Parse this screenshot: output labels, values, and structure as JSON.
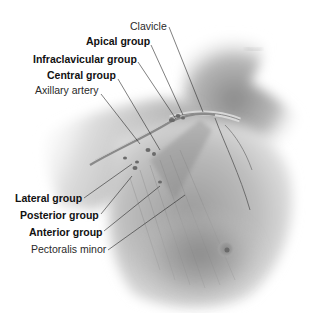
{
  "figure": {
    "illustration": "grayscale anatomical rendering of right shoulder, neck and chest with lymph nodes and muscles"
  },
  "labels": [
    {
      "id": "clavicle",
      "text": "Clavicle",
      "weight": "regular",
      "x": 130,
      "y": 20,
      "line": [
        169,
        27,
        203,
        112
      ]
    },
    {
      "id": "apical-group",
      "text": "Apical group",
      "weight": "bold",
      "x": 86,
      "y": 35,
      "line": [
        151,
        45,
        183,
        115
      ]
    },
    {
      "id": "infraclavicular-group",
      "text": "Infraclavicular group",
      "weight": "bold",
      "x": 33,
      "y": 53,
      "line": [
        138,
        62,
        176,
        119
      ]
    },
    {
      "id": "central-group",
      "text": "Central group",
      "weight": "bold",
      "x": 47,
      "y": 69,
      "line": [
        118,
        79,
        160,
        150
      ]
    },
    {
      "id": "axillary-artery",
      "text": "Axillary artery",
      "weight": "regular",
      "x": 35,
      "y": 84,
      "line": [
        101,
        94,
        140,
        144
      ]
    },
    {
      "id": "lateral-group",
      "text": "Lateral group",
      "weight": "bold",
      "x": 15,
      "y": 192,
      "line": [
        84,
        198,
        132,
        164
      ]
    },
    {
      "id": "posterior-group",
      "text": "Posterior group",
      "weight": "bold",
      "x": 20,
      "y": 209,
      "line": [
        101,
        214,
        132,
        176
      ]
    },
    {
      "id": "anterior-group",
      "text": "Anterior group",
      "weight": "bold",
      "x": 29,
      "y": 226,
      "line": [
        104,
        231,
        160,
        186
      ]
    },
    {
      "id": "pectoralis-minor",
      "text": "Pectoralis minor",
      "weight": "regular",
      "x": 31,
      "y": 243,
      "line": [
        108,
        250,
        185,
        195
      ]
    }
  ],
  "colors": {
    "background": "#ffffff",
    "label_text": "#1a1a1a",
    "leader_line": "#2a2a2a",
    "skin_light": "#e8e8e8",
    "skin_mid": "#b0b0b0",
    "skin_dark": "#6a6a6a"
  }
}
